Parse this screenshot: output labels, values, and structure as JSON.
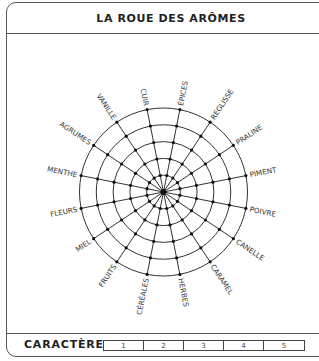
{
  "header": {
    "title": "LA ROUE DES ARÔMES"
  },
  "wheel": {
    "center": [
      163.5,
      192
    ],
    "radius": 84,
    "rings": 5,
    "spokes": 16,
    "labels": [
      "ÉPICES",
      "REGLISSE",
      "PRALINE",
      "PIMENT",
      "POIVRE",
      "CANELLE",
      "CARAMEL",
      "HERBES",
      "CÉRÉALES",
      "FRUITS",
      "MIEL",
      "FLEURS",
      "MENTHE",
      "AGRUMES",
      "VANILLE",
      "CUIR"
    ],
    "line_color": "#333333"
  },
  "footer": {
    "label": "CARACTÈRE",
    "scale": [
      "1",
      "2",
      "3",
      "4",
      "5"
    ]
  }
}
